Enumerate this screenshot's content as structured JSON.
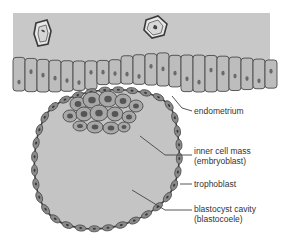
{
  "colors": {
    "background": "#ffffff",
    "stroma": "#c8c8c8",
    "epithelium_cell": "#bdbdbd",
    "cell_outline": "#4a4a4a",
    "nucleus": "#6a6a6a",
    "cavity": "#c4c4c4",
    "trophoblast_cell": "#8a8a8a",
    "icm_cell": "#a8a8a8",
    "leader_line": "#444444",
    "text": "#333333"
  },
  "labels": [
    {
      "id": "endometrium",
      "lines": [
        "endometrium"
      ]
    },
    {
      "id": "inner-cell-mass",
      "lines": [
        "inner cell mass",
        "(embryoblast)"
      ]
    },
    {
      "id": "trophoblast",
      "lines": [
        "trophoblast"
      ]
    },
    {
      "id": "blastocyst-cavity",
      "lines": [
        "blastocyst cavity",
        "(blastocoele)"
      ]
    }
  ]
}
